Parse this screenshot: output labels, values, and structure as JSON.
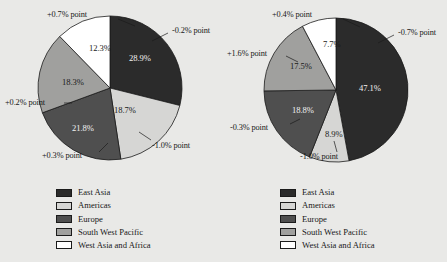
{
  "page": {
    "background": "#e9e9e7",
    "text_color": "#181818"
  },
  "palette": {
    "east_asia": "#2b2b2b",
    "americas": "#d6d6d4",
    "europe": "#4f4f4f",
    "south_west_pacific": "#a0a09e",
    "west_asia_and_africa": "#ffffff",
    "wedge_border": "#1b1b1b"
  },
  "legend": {
    "items": [
      {
        "label": "East Asia",
        "color": "#2b2b2b",
        "key": "east_asia"
      },
      {
        "label": "Americas",
        "color": "#d6d6d4",
        "key": "americas"
      },
      {
        "label": "Europe",
        "color": "#4f4f4f",
        "key": "europe"
      },
      {
        "label": "South West Pacific",
        "color": "#a0a09e",
        "key": "south_west_pacific"
      },
      {
        "label": "West Asia and Africa",
        "color": "#ffffff",
        "key": "west_asia_and_africa"
      }
    ]
  },
  "chart_data": [
    {
      "type": "pie",
      "id": "left-pie",
      "title": "",
      "legend_position": "bottom",
      "start_angle_deg": 0,
      "direction": "clockwise",
      "categories": [
        "East Asia",
        "Americas",
        "Europe",
        "South West Pacific",
        "West Asia and Africa"
      ],
      "values": [
        28.9,
        18.7,
        21.8,
        18.3,
        12.3
      ],
      "value_labels": [
        "28.9%",
        "18.7%",
        "21.8%",
        "18.3%",
        "12.3%"
      ],
      "colors": [
        "#2b2b2b",
        "#d6d6d4",
        "#4f4f4f",
        "#a0a09e",
        "#ffffff"
      ],
      "annotations": [
        {
          "text": "-0.2% point",
          "series": "East Asia",
          "delta": -0.2
        },
        {
          "text": "-1.0% point",
          "series": "Americas",
          "delta": -1.0
        },
        {
          "text": "+0.3% point",
          "series": "Europe",
          "delta": 0.3
        },
        {
          "text": "+0.2% point",
          "series": "South West Pacific",
          "delta": 0.2
        },
        {
          "text": "+0.7% point",
          "series": "West Asia and Africa",
          "delta": 0.7
        }
      ]
    },
    {
      "type": "pie",
      "id": "right-pie",
      "title": "",
      "legend_position": "bottom",
      "start_angle_deg": 0,
      "direction": "clockwise",
      "categories": [
        "East Asia",
        "Americas",
        "Europe",
        "South West Pacific",
        "West Asia and Africa"
      ],
      "values": [
        47.1,
        8.9,
        18.8,
        17.5,
        7.7
      ],
      "value_labels": [
        "47.1%",
        "8.9%",
        "18.8%",
        "17.5%",
        "7.7%"
      ],
      "colors": [
        "#2b2b2b",
        "#d6d6d4",
        "#4f4f4f",
        "#a0a09e",
        "#ffffff"
      ],
      "annotations": [
        {
          "text": "-0.7% point",
          "series": "East Asia",
          "delta": -0.7
        },
        {
          "text": "-1.0% point",
          "series": "Americas",
          "delta": -1.0
        },
        {
          "text": "-0.3% point",
          "series": "Europe",
          "delta": -0.3
        },
        {
          "text": "+1.6% point",
          "series": "South West Pacific",
          "delta": 1.6
        },
        {
          "text": "+0.4% point",
          "series": "West Asia and Africa",
          "delta": 0.4
        }
      ]
    }
  ],
  "left": {
    "slice_labels": {
      "east_asia": "28.9%",
      "americas": "18.7%",
      "europe": "21.8%",
      "south_west_pacific": "18.3%",
      "west_asia_and_africa": "12.3%"
    },
    "annotations": {
      "east_asia": "-0.2% point",
      "americas": "-1.0% point",
      "europe": "+0.3% point",
      "south_west_pacific": "+0.2% point",
      "west_asia_and_africa": "+0.7% point"
    }
  },
  "right": {
    "slice_labels": {
      "east_asia": "47.1%",
      "americas": "8.9%",
      "europe": "18.8%",
      "south_west_pacific": "17.5%",
      "west_asia_and_africa": "7.7%"
    },
    "annotations": {
      "east_asia": "-0.7% point",
      "americas": "-1.0% point",
      "europe": "-0.3% point",
      "south_west_pacific": "+1.6% point",
      "west_asia_and_africa": "+0.4% point"
    }
  }
}
